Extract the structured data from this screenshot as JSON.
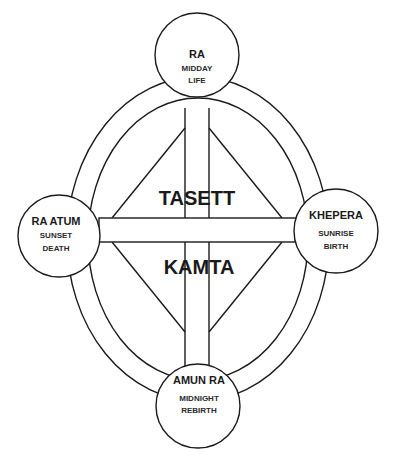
{
  "diagram": {
    "center_labels": {
      "upper": "TASETT",
      "lower": "KAMTA"
    },
    "nodes": [
      {
        "position": "top",
        "name": "RA",
        "lines": [
          "MIDDAY",
          "LIFE"
        ]
      },
      {
        "position": "left",
        "name": "RA ATUM",
        "lines": [
          "SUNSET",
          "DEATH"
        ]
      },
      {
        "position": "right",
        "name": "KHEPERA",
        "lines": [
          "SUNRISE",
          "BIRTH"
        ]
      },
      {
        "position": "bottom",
        "name": "AMUN RA",
        "lines": [
          "MIDNIGHT",
          "REBIRTH"
        ]
      }
    ],
    "colors": {
      "line": "#1a1a1a",
      "background": "#ffffff"
    }
  }
}
